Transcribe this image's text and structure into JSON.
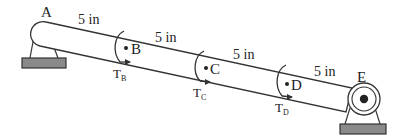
{
  "diagram": {
    "type": "shaft-torque-diagram",
    "shaft": {
      "color": "#333333",
      "fill": "#ffffff"
    },
    "points": [
      {
        "id": "A",
        "label": "A",
        "role": "fixed-support"
      },
      {
        "id": "B",
        "label": "B",
        "role": "torque-point"
      },
      {
        "id": "C",
        "label": "C",
        "role": "torque-point"
      },
      {
        "id": "D",
        "label": "D",
        "role": "torque-point"
      },
      {
        "id": "E",
        "label": "E",
        "role": "bearing-support"
      }
    ],
    "segments": [
      {
        "from": "A",
        "to": "B",
        "label": "5 in"
      },
      {
        "from": "B",
        "to": "C",
        "label": "5 in"
      },
      {
        "from": "C",
        "to": "D",
        "label": "5 in"
      },
      {
        "from": "D",
        "to": "E",
        "label": "5 in"
      }
    ],
    "torques": [
      {
        "at": "B",
        "symbol": "T",
        "subscript": "B"
      },
      {
        "at": "C",
        "symbol": "T",
        "subscript": "C"
      },
      {
        "at": "D",
        "symbol": "T",
        "subscript": "D"
      }
    ],
    "supports": {
      "base_color": "#8a8a8a",
      "base_stroke": "#333333"
    }
  }
}
